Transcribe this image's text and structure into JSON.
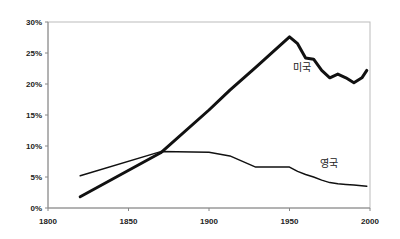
{
  "chart_data": {
    "type": "line",
    "title": "",
    "xlabel": "",
    "ylabel": "",
    "xlim": [
      1800,
      2000
    ],
    "ylim": [
      0,
      30
    ],
    "grid": false,
    "legend": "inline labels",
    "x_ticks": [
      "1800",
      "1850",
      "1900",
      "1950",
      "2000"
    ],
    "y_ticks": [
      "0%",
      "5%",
      "10%",
      "15%",
      "20%",
      "25%",
      "30%"
    ],
    "series": [
      {
        "name": "미국",
        "label": "미국",
        "stroke_width": 3,
        "x": [
          1820,
          1870,
          1900,
          1913,
          1929,
          1950,
          1955,
          1960,
          1965,
          1970,
          1975,
          1980,
          1985,
          1990,
          1995,
          1998
        ],
        "values": [
          1.8,
          8.9,
          15.8,
          19.0,
          22.7,
          27.6,
          26.5,
          24.2,
          24.0,
          22.2,
          21.0,
          21.6,
          21.0,
          20.2,
          21.0,
          22.2
        ]
      },
      {
        "name": "영국",
        "label": "영국",
        "stroke_width": 1.5,
        "x": [
          1820,
          1870,
          1900,
          1913,
          1929,
          1950,
          1955,
          1960,
          1965,
          1970,
          1975,
          1980,
          1985,
          1990,
          1998
        ],
        "values": [
          5.2,
          9.1,
          9.0,
          8.4,
          6.6,
          6.6,
          5.9,
          5.4,
          5.0,
          4.5,
          4.1,
          3.9,
          3.8,
          3.7,
          3.5
        ]
      }
    ]
  },
  "labels": {
    "us": "미국",
    "uk": "영국"
  }
}
